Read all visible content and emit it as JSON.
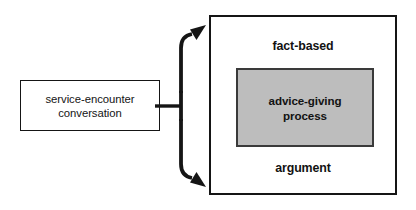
{
  "diagram": {
    "colors": {
      "line": "#151515",
      "inner_fill": "#bdbdbd",
      "inner_border": "#3a3a3a",
      "background": "#ffffff",
      "text": "#121212"
    },
    "source_node": {
      "label": "service-encounter\nconversation"
    },
    "connector": {
      "icon_top": "curved-arrow-up-right-icon",
      "icon_bottom": "curved-arrow-down-right-icon",
      "stem": "horizontal-stem"
    },
    "target_node": {
      "top_label": "fact-based",
      "bottom_label": "argument",
      "inner_node": {
        "label": "advice-giving\nprocess"
      }
    }
  }
}
